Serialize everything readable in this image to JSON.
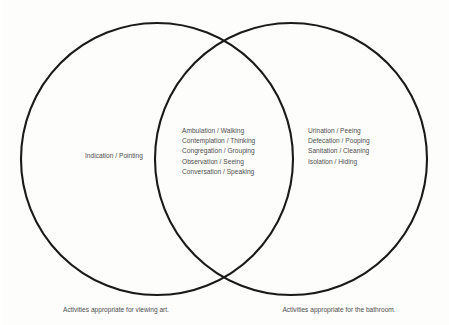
{
  "diagram": {
    "type": "venn",
    "title_visible": false,
    "background_color": "#fdfdfb",
    "stroke_color": "#1a1a1a",
    "text_color": "#4e4e4e",
    "left_circle": {
      "center_x": 157,
      "center_y": 159,
      "radius": 136
    },
    "right_circle": {
      "center_x": 291,
      "center_y": 159,
      "radius": 136
    }
  },
  "left_region": {
    "label": "Indication / Pointing"
  },
  "center_region": {
    "items": [
      "Ambulation / Walking",
      "Contemplation / Thinking",
      "Congregation / Grouping",
      "Observation / Seeing",
      "Conversation / Speaking"
    ]
  },
  "right_region": {
    "items": [
      "Urination / Peeing",
      "Defecation / Pooping",
      "Sanitation / Cleaning",
      "Isolation / Hiding"
    ]
  },
  "captions": {
    "left": "Activities appropriate for viewing art.",
    "right": "Activities appropriate for the bathroom."
  }
}
